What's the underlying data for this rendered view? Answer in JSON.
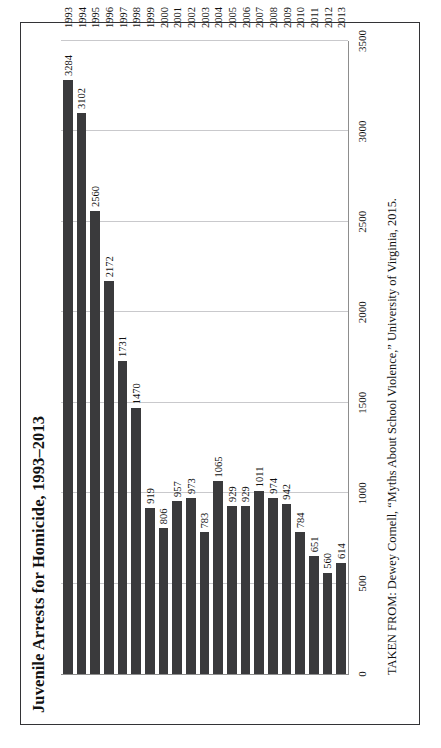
{
  "figure": {
    "title": "Juvenile Arrests for Homicide, 1993–2013",
    "source": "TAKEN FROM: Dewey Cornell, “Myths About School Violence,” University of Virginia, 2015."
  },
  "colors": {
    "bar": "#3a3a3c",
    "grid": "#c9c9cc",
    "axis": "#8d8d8d",
    "frame": "#333336",
    "text": "#111111",
    "background": "#ffffff"
  },
  "chart_data": {
    "type": "bar",
    "title": "Juvenile Arrests for Homicide, 1993–2013",
    "xlabel": "",
    "ylabel": "",
    "ylim": [
      0,
      3500
    ],
    "yticks": [
      0,
      500,
      1000,
      1500,
      2000,
      2500,
      3000,
      3500
    ],
    "grid": true,
    "legend": null,
    "orientation": "vertical-bars-rotated-90ccw",
    "categories": [
      "1993",
      "1994",
      "1995",
      "1996",
      "1997",
      "1998",
      "1999",
      "2000",
      "2001",
      "2002",
      "2003",
      "2004",
      "2005",
      "2006",
      "2007",
      "2008",
      "2009",
      "2010",
      "2011",
      "2012",
      "2013"
    ],
    "values": [
      3284,
      3102,
      2560,
      2172,
      1731,
      1470,
      919,
      806,
      957,
      973,
      783,
      1065,
      929,
      929,
      1011,
      974,
      942,
      784,
      651,
      560,
      614
    ],
    "data_labels": [
      "3284",
      "3102",
      "2560",
      "2172",
      "1731",
      "1470",
      "919",
      "806",
      "957",
      "973",
      "783",
      "1065",
      "929",
      "929",
      "1011",
      "974",
      "942",
      "784",
      "651",
      "560",
      "614"
    ],
    "annotations": [
      "TAKEN FROM: Dewey Cornell, “Myths About School Violence,” University of Virginia, 2015."
    ]
  }
}
